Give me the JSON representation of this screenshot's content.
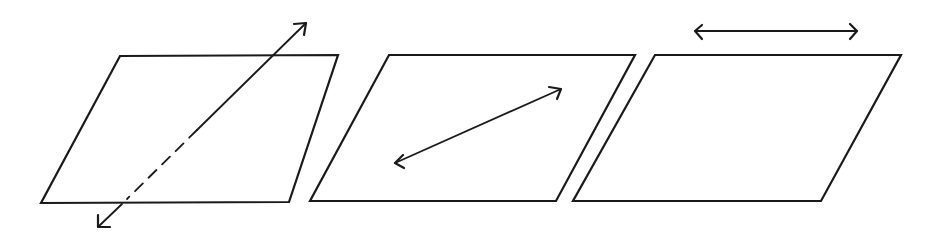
{
  "diagram": {
    "title": "",
    "stroke_color": "#1a1a1a",
    "background": "#ffffff",
    "panels": [
      {
        "name": "line-intersecting-plane",
        "plane": [
          [
            120,
            56
          ],
          [
            338,
            55
          ],
          [
            289,
            202
          ],
          [
            41,
            203
          ]
        ],
        "line": {
          "from": [
            306,
            23
          ],
          "to": [
            98,
            227
          ],
          "solid_above": [
            [
              306,
              23
            ],
            [
              275,
              56
            ],
            [
              198,
              126
            ]
          ],
          "dashed_segment": [
            [
              198,
              126
            ],
            [
              127,
              199
            ]
          ]
        },
        "arrowheads": 2
      },
      {
        "name": "line-in-plane",
        "plane": [
          [
            389,
            55
          ],
          [
            635,
            55
          ],
          [
            556,
            201
          ],
          [
            310,
            201
          ]
        ],
        "line": {
          "from": [
            394,
            164
          ],
          "to": [
            562,
            88
          ]
        },
        "arrowheads": 2
      },
      {
        "name": "line-parallel-to-plane",
        "plane": [
          [
            655,
            55
          ],
          [
            901,
            55
          ],
          [
            821,
            201
          ],
          [
            573,
            201
          ]
        ],
        "line": {
          "from": [
            694,
            31
          ],
          "to": [
            858,
            31
          ]
        },
        "arrowheads": 2
      }
    ]
  }
}
